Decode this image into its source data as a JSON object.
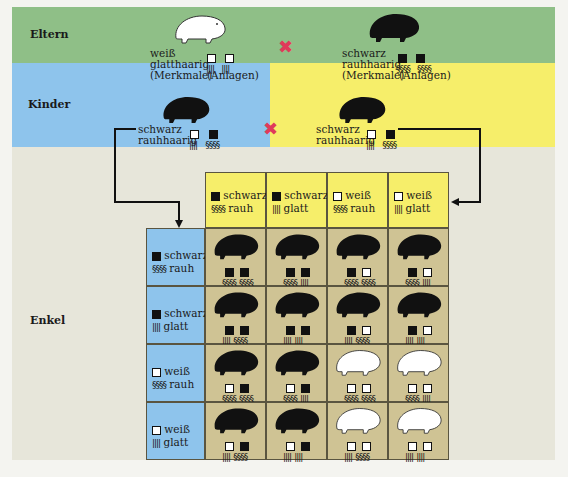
{
  "colors": {
    "eltern_bg": "#8fbf87",
    "kinder_left_bg": "#8ec4ec",
    "kinder_right_bg": "#f6ee6a",
    "enkel_bg": "#e7e6da",
    "cell_bg": "#cfc394",
    "cross": "#e03a5a"
  },
  "legend_symbols": {
    "black_square": "schwarz",
    "white_square": "weiß",
    "wavy_lines": "rauh",
    "straight_lines": "glatt"
  },
  "eltern": {
    "label": "Eltern",
    "cross_symbol": "✖",
    "parent1": {
      "animal": "white-guinea-pig",
      "trait_color": "weiß",
      "trait_hair": "glatthaarig",
      "caption_traits": "(Merkmale)",
      "caption_genes": "(Anlagen)",
      "genes": [
        {
          "color": "white",
          "hair": "glatt"
        },
        {
          "color": "white",
          "hair": "glatt"
        }
      ]
    },
    "parent2": {
      "animal": "black-guinea-pig",
      "trait_color": "schwarz",
      "trait_hair": "rauhhaarig",
      "caption_traits": "(Merkmale)",
      "caption_genes": "(Anlagen)",
      "genes": [
        {
          "color": "black",
          "hair": "rauh"
        },
        {
          "color": "black",
          "hair": "rauh"
        }
      ]
    }
  },
  "kinder": {
    "label": "Kinder",
    "cross_symbol": "✖",
    "child1": {
      "animal": "black-guinea-pig",
      "trait_color": "schwarz",
      "trait_hair": "rauhhaarig",
      "genes": [
        {
          "color": "white",
          "hair": "glatt"
        },
        {
          "color": "black",
          "hair": "rauh"
        }
      ]
    },
    "child2": {
      "animal": "black-guinea-pig",
      "trait_color": "schwarz",
      "trait_hair": "rauhhaarig",
      "genes": [
        {
          "color": "white",
          "hair": "glatt"
        },
        {
          "color": "black",
          "hair": "rauh"
        }
      ]
    }
  },
  "enkel": {
    "label": "Enkel",
    "column_headers": [
      {
        "color": "black",
        "color_label": "schwarz",
        "hair": "rauh",
        "hair_label": "rauh"
      },
      {
        "color": "black",
        "color_label": "schwarz",
        "hair": "glatt",
        "hair_label": "glatt"
      },
      {
        "color": "white",
        "color_label": "weiß",
        "hair": "rauh",
        "hair_label": "rauh"
      },
      {
        "color": "white",
        "color_label": "weiß",
        "hair": "glatt",
        "hair_label": "glatt"
      }
    ],
    "row_headers": [
      {
        "color": "black",
        "color_label": "schwarz",
        "hair": "rauh",
        "hair_label": "rauh"
      },
      {
        "color": "black",
        "color_label": "schwarz",
        "hair": "glatt",
        "hair_label": "glatt"
      },
      {
        "color": "white",
        "color_label": "weiß",
        "hair": "rauh",
        "hair_label": "rauh"
      },
      {
        "color": "white",
        "color_label": "weiß",
        "hair": "glatt",
        "hair_label": "glatt"
      }
    ],
    "cells": [
      [
        {
          "phenotype": "black",
          "genes": [
            {
              "color": "black",
              "hair": "rauh"
            },
            {
              "color": "black",
              "hair": "rauh"
            }
          ]
        },
        {
          "phenotype": "black",
          "genes": [
            {
              "color": "black",
              "hair": "rauh"
            },
            {
              "color": "black",
              "hair": "glatt"
            }
          ]
        },
        {
          "phenotype": "black",
          "genes": [
            {
              "color": "black",
              "hair": "rauh"
            },
            {
              "color": "white",
              "hair": "rauh"
            }
          ]
        },
        {
          "phenotype": "black",
          "genes": [
            {
              "color": "black",
              "hair": "rauh"
            },
            {
              "color": "white",
              "hair": "glatt"
            }
          ]
        }
      ],
      [
        {
          "phenotype": "black",
          "genes": [
            {
              "color": "black",
              "hair": "glatt"
            },
            {
              "color": "black",
              "hair": "rauh"
            }
          ]
        },
        {
          "phenotype": "black",
          "genes": [
            {
              "color": "black",
              "hair": "glatt"
            },
            {
              "color": "black",
              "hair": "glatt"
            }
          ]
        },
        {
          "phenotype": "black",
          "genes": [
            {
              "color": "black",
              "hair": "glatt"
            },
            {
              "color": "white",
              "hair": "rauh"
            }
          ]
        },
        {
          "phenotype": "black",
          "genes": [
            {
              "color": "black",
              "hair": "glatt"
            },
            {
              "color": "white",
              "hair": "glatt"
            }
          ]
        }
      ],
      [
        {
          "phenotype": "black",
          "genes": [
            {
              "color": "white",
              "hair": "rauh"
            },
            {
              "color": "black",
              "hair": "rauh"
            }
          ]
        },
        {
          "phenotype": "black",
          "genes": [
            {
              "color": "white",
              "hair": "rauh"
            },
            {
              "color": "black",
              "hair": "glatt"
            }
          ]
        },
        {
          "phenotype": "white",
          "genes": [
            {
              "color": "white",
              "hair": "rauh"
            },
            {
              "color": "white",
              "hair": "rauh"
            }
          ]
        },
        {
          "phenotype": "white",
          "genes": [
            {
              "color": "white",
              "hair": "rauh"
            },
            {
              "color": "white",
              "hair": "glatt"
            }
          ]
        }
      ],
      [
        {
          "phenotype": "black",
          "genes": [
            {
              "color": "white",
              "hair": "glatt"
            },
            {
              "color": "black",
              "hair": "rauh"
            }
          ]
        },
        {
          "phenotype": "black",
          "genes": [
            {
              "color": "white",
              "hair": "glatt"
            },
            {
              "color": "black",
              "hair": "glatt"
            }
          ]
        },
        {
          "phenotype": "white",
          "genes": [
            {
              "color": "white",
              "hair": "glatt"
            },
            {
              "color": "white",
              "hair": "rauh"
            }
          ]
        },
        {
          "phenotype": "white",
          "genes": [
            {
              "color": "white",
              "hair": "glatt"
            },
            {
              "color": "white",
              "hair": "glatt"
            }
          ]
        }
      ]
    ]
  },
  "glyphs": {
    "rauh": "§§§§",
    "glatt": "||||"
  }
}
